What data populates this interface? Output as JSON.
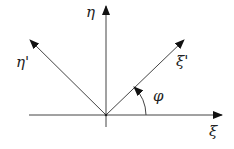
{
  "diagram": {
    "type": "coordinate-rotation",
    "axes": {
      "xi": {
        "label": "ξ"
      },
      "eta": {
        "label": "η"
      },
      "xi_prime": {
        "label": "ξ'"
      },
      "eta_prime": {
        "label": "η'"
      }
    },
    "angle": {
      "label": "φ"
    },
    "colors": {
      "line": "#333333",
      "background": "#ffffff"
    }
  }
}
